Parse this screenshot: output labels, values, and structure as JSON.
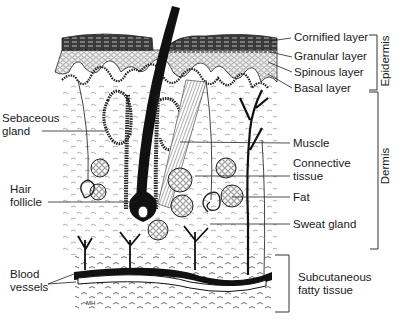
{
  "figure": {
    "signature": "MH"
  },
  "labels_right": [
    {
      "id": "cornified",
      "text": "Cornified layer"
    },
    {
      "id": "granular",
      "text": "Granular layer"
    },
    {
      "id": "spinous",
      "text": "Spinous layer"
    },
    {
      "id": "basal",
      "text": "Basal layer"
    },
    {
      "id": "muscle",
      "text": "Muscle"
    },
    {
      "id": "connective1",
      "text": "Connective"
    },
    {
      "id": "connective2",
      "text": "tissue"
    },
    {
      "id": "fat",
      "text": "Fat"
    },
    {
      "id": "sweat",
      "text": "Sweat gland"
    },
    {
      "id": "subcut1",
      "text": "Subcutaneous"
    },
    {
      "id": "subcut2",
      "text": "fatty tissue"
    }
  ],
  "labels_left": [
    {
      "id": "sebaceous1",
      "text": "Sebaceous"
    },
    {
      "id": "sebaceous2",
      "text": "gland"
    },
    {
      "id": "hair1",
      "text": "Hair"
    },
    {
      "id": "hair2",
      "text": "follicle"
    },
    {
      "id": "blood1",
      "text": "Blood"
    },
    {
      "id": "blood2",
      "text": "vessels"
    }
  ],
  "brackets": [
    {
      "id": "epidermis",
      "text": "Epidermis"
    },
    {
      "id": "dermis",
      "text": "Dermis"
    }
  ]
}
